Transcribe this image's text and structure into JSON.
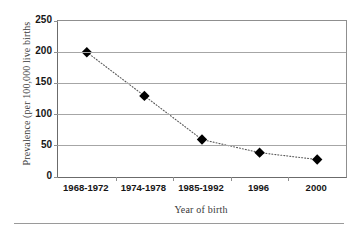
{
  "chart_data": {
    "type": "line",
    "title": "",
    "xlabel": "Year of birth",
    "ylabel": "Prevalence (per 100,000 live births",
    "categories": [
      "1968-1972",
      "1974-1978",
      "1985-1992",
      "1996",
      "2000"
    ],
    "values": [
      200,
      130,
      60,
      39,
      28
    ],
    "series": [
      {
        "name": "Prevalence",
        "values": [
          200,
          130,
          60,
          39,
          28
        ]
      }
    ],
    "ylim": [
      0,
      250
    ],
    "yticks": [
      0,
      50,
      100,
      150,
      200,
      250
    ],
    "ytick_labels": [
      "0",
      "50",
      "100",
      "150",
      "200",
      "250"
    ],
    "grid": "horizontal",
    "legend": "none",
    "marker": "diamond",
    "marker_color": "#000000",
    "line_style": "dotted",
    "line_color": "#5a5a5a",
    "gridline_color": "#a6a6a6",
    "axis_color": "#6b6b6b",
    "background_color": "#ffffff"
  }
}
